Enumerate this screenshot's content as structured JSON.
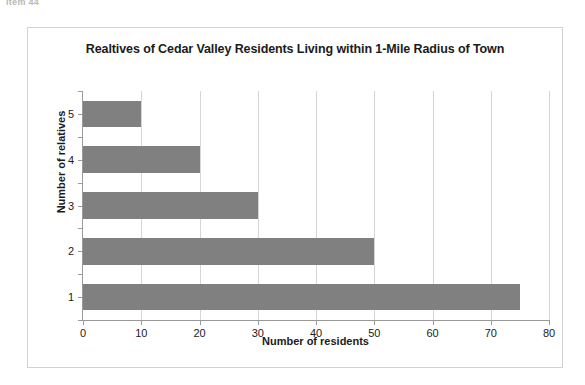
{
  "scan": {
    "header_text": "Item 44"
  },
  "chart_data": {
    "type": "bar",
    "orientation": "horizontal",
    "title": "Realtives of Cedar Valley Residents Living within 1-Mile Radius of Town",
    "xlabel": "Number of residents",
    "ylabel": "Number of relatives",
    "categories": [
      "1",
      "2",
      "3",
      "4",
      "5"
    ],
    "values": [
      75,
      50,
      30,
      20,
      10
    ],
    "category_order_top_to_bottom": [
      "5",
      "4",
      "3",
      "2",
      "1"
    ],
    "xlim": [
      0,
      80
    ],
    "x_tick_step": 10,
    "x_ticks": [
      "0",
      "10",
      "20",
      "30",
      "40",
      "50",
      "60",
      "70",
      "80"
    ],
    "y_ticks": [
      "5",
      "4",
      "3",
      "2",
      "1"
    ],
    "grid": "vertical",
    "legend": "none",
    "bar_color": "#808080",
    "gridline_color": "#d6d6d6",
    "axis_color": "#9a9a9a",
    "text_color": "#1b1b1b",
    "frame_color": "#d2d2d2"
  }
}
